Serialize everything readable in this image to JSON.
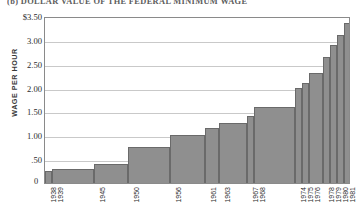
{
  "chart_data": {
    "type": "bar",
    "title": "(b) DOLLAR VALUE OF THE FEDERAL MINIMUM WAGE",
    "xlabel": "",
    "ylabel": "WAGE PER HOUR",
    "ylim": [
      0,
      3.5
    ],
    "grid": true,
    "legend": "none",
    "origin_label": "0",
    "y_ticks": [
      {
        "value": 3.5,
        "label": "$3.50"
      },
      {
        "value": 3.0,
        "label": "3.00"
      },
      {
        "value": 2.5,
        "label": "2.50"
      },
      {
        "value": 2.0,
        "label": "2.00"
      },
      {
        "value": 1.5,
        "label": "1.50"
      },
      {
        "value": 1.0,
        "label": "1.00"
      },
      {
        "value": 0.5,
        "label": ".50"
      }
    ],
    "categories": [
      "1938",
      "1939",
      "1945",
      "1950",
      "1956",
      "1961",
      "1963",
      "1967",
      "1968",
      "1974",
      "1975",
      "1976",
      "1978",
      "1979",
      "1980",
      "1981"
    ],
    "values": [
      0.25,
      0.3,
      0.4,
      0.75,
      1.0,
      1.15,
      1.25,
      1.4,
      1.6,
      2.0,
      2.1,
      2.3,
      2.65,
      2.9,
      3.1,
      3.35
    ],
    "bar_spans": [
      {
        "category": "1938",
        "start": 1938,
        "end": 1939,
        "value": 0.25
      },
      {
        "category": "1939",
        "start": 1939,
        "end": 1945,
        "value": 0.3
      },
      {
        "category": "1945",
        "start": 1945,
        "end": 1950,
        "value": 0.4
      },
      {
        "category": "1950",
        "start": 1950,
        "end": 1956,
        "value": 0.75
      },
      {
        "category": "1956",
        "start": 1956,
        "end": 1961,
        "value": 1.0
      },
      {
        "category": "1961",
        "start": 1961,
        "end": 1963,
        "value": 1.15
      },
      {
        "category": "1963",
        "start": 1963,
        "end": 1967,
        "value": 1.25
      },
      {
        "category": "1967",
        "start": 1967,
        "end": 1968,
        "value": 1.4
      },
      {
        "category": "1968",
        "start": 1968,
        "end": 1974,
        "value": 1.6
      },
      {
        "category": "1974",
        "start": 1974,
        "end": 1975,
        "value": 2.0
      },
      {
        "category": "1975",
        "start": 1975,
        "end": 1976,
        "value": 2.1
      },
      {
        "category": "1976",
        "start": 1976,
        "end": 1978,
        "value": 2.3
      },
      {
        "category": "1978",
        "start": 1978,
        "end": 1979,
        "value": 2.65
      },
      {
        "category": "1979",
        "start": 1979,
        "end": 1980,
        "value": 2.9
      },
      {
        "category": "1980",
        "start": 1980,
        "end": 1981,
        "value": 3.1
      },
      {
        "category": "1981",
        "start": 1981,
        "end": 1982,
        "value": 3.35
      }
    ],
    "colors": {
      "bar_fill": "#8f8f8f",
      "bar_edge": "#6a6a6a",
      "gridline": "#c9c9c9",
      "axis": "#8a8a8a",
      "text": "#2b2b2b",
      "title": "#5d5d5d"
    }
  }
}
